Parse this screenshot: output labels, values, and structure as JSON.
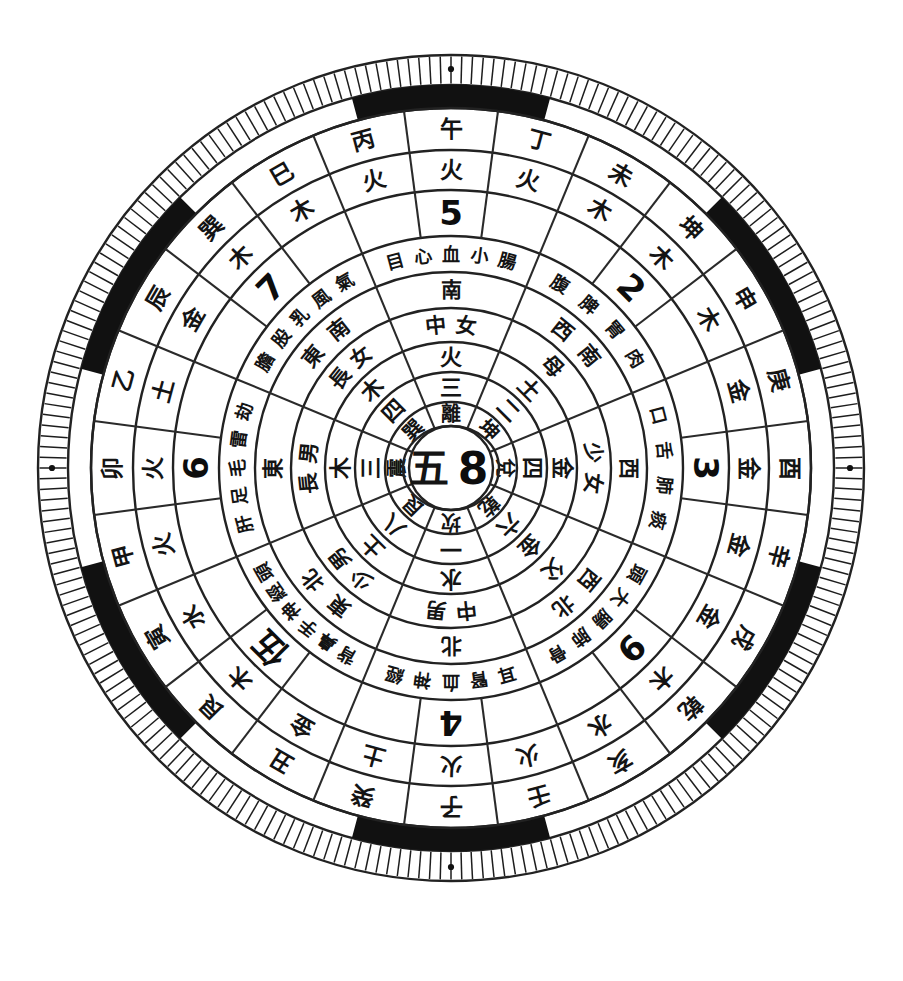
{
  "figure": {
    "kind": "luopan-compass",
    "title": "",
    "center_text_cn": "五",
    "center_text_num": "8",
    "background": "#ffffff",
    "ink_color": "#1a1a1a",
    "geometry": {
      "cx": 451,
      "cy": 468,
      "outer_radius": 413,
      "sectors": 24,
      "tick_count": 240
    }
  },
  "rings": {
    "r1_tick_ring": {
      "name": "outer-tick-ring",
      "r_outer": 413,
      "r_inner": 383,
      "ticks": 240,
      "note": "fine radial hatch marks"
    },
    "r2_black_white_ring": {
      "name": "black-white-segment-ring",
      "r_outer": 383,
      "r_inner": 360,
      "pattern": [
        "black",
        "white",
        "black",
        "white",
        "black",
        "white",
        "black",
        "white",
        "black",
        "white",
        "black",
        "white"
      ],
      "dots": 4,
      "dot_color": "#111111"
    },
    "r3_branch_ring": {
      "name": "earthly-branch-ring",
      "r_outer": 360,
      "r_inner": 318
    },
    "r4_element_ring": {
      "name": "five-element-ring",
      "r_outer": 318,
      "r_inner": 278
    },
    "r5_number_ring": {
      "name": "arabic-number-ring",
      "r_outer": 278,
      "r_inner": 232
    },
    "r6_body_ring": {
      "name": "body-organ-ring",
      "r_outer": 232,
      "r_inner": 196
    },
    "r7_direction_ring": {
      "name": "direction-ring",
      "r_outer": 196,
      "r_inner": 160
    },
    "r8_family_ring": {
      "name": "family-member-ring",
      "r_outer": 160,
      "r_inner": 126
    },
    "r9_element2_ring": {
      "name": "trigram-element-ring",
      "r_outer": 126,
      "r_inner": 96
    },
    "r10_cn_number_ring": {
      "name": "chinese-number-ring",
      "r_outer": 96,
      "r_inner": 66
    },
    "r11_trigram_ring": {
      "name": "eight-trigram-ring",
      "r_outer": 66,
      "r_inner": 42
    },
    "r12_center": {
      "name": "center-disc",
      "r_outer": 42
    }
  },
  "sectors24": {
    "label": "24-mountain branch ring (outermost lettered ring)",
    "branches": [
      "午",
      "丁",
      "未",
      "坤",
      "申",
      "庚",
      "酉",
      "辛",
      "戌",
      "乾",
      "亥",
      "壬",
      "子",
      "癸",
      "丑",
      "艮",
      "寅",
      "甲",
      "卯",
      "乙",
      "辰",
      "巽",
      "巳",
      "丙"
    ],
    "elements": [
      "火",
      "火",
      "木",
      "木",
      "木",
      "金",
      "金",
      "金",
      "金",
      "木",
      "水",
      "火",
      "火",
      "土",
      "金",
      "木",
      "水",
      "火",
      "火",
      "土",
      "金",
      "木",
      "木",
      "火"
    ]
  },
  "eight_palaces": [
    {
      "id": "li",
      "position_deg": 0,
      "trigram": "離",
      "cn_number": "三",
      "element": "火",
      "family": "中女",
      "direction": "南",
      "body": "目心血小腸",
      "number": "5",
      "nature": "麗"
    },
    {
      "id": "kun",
      "position_deg": 45,
      "trigram": "坤",
      "cn_number": "二",
      "element": "土",
      "family": "母",
      "direction": "西南",
      "body": "腹脾胃肉",
      "number": "2",
      "nature": "地"
    },
    {
      "id": "dui",
      "position_deg": 90,
      "trigram": "兌",
      "cn_number": "四",
      "element": "金",
      "family": "少女",
      "direction": "西",
      "body": "口舌肺痰",
      "number": "3",
      "nature": "澤"
    },
    {
      "id": "qian",
      "position_deg": 135,
      "trigram": "乾",
      "cn_number": "六",
      "element": "金",
      "family": "父",
      "direction": "西北",
      "body": "頭大腸肺骨",
      "number": "9",
      "nature": "天"
    },
    {
      "id": "kan",
      "position_deg": 180,
      "trigram": "坎",
      "cn_number": "一",
      "element": "水",
      "family": "中男",
      "direction": "北",
      "body": "耳腎血神經",
      "number": "4",
      "nature": "水"
    },
    {
      "id": "gen",
      "position_deg": 225,
      "trigram": "艮",
      "cn_number": "八",
      "element": "土",
      "family": "少男",
      "direction": "東北",
      "body": "背鼻手神經頭",
      "number": "伍",
      "nature": "山"
    },
    {
      "id": "zhen",
      "position_deg": 270,
      "trigram": "震",
      "cn_number": "三",
      "element": "木",
      "family": "長男",
      "direction": "東",
      "body": "肝足毛雷劫",
      "number": "6",
      "nature": "雷"
    },
    {
      "id": "xun",
      "position_deg": 315,
      "trigram": "巽",
      "cn_number": "四",
      "element": "木",
      "family": "長女",
      "direction": "東南",
      "body": "膽股乳風氣",
      "number": "7",
      "nature": "風"
    }
  ],
  "inner_number_ring": {
    "label": "chinese-number-ring values by palace",
    "values": [
      "三",
      "二",
      "四",
      "六",
      "一",
      "八",
      "三",
      "壹"
    ]
  },
  "outer_arabic_ring": {
    "label": "arabic-number-ring values by palace",
    "values": [
      "5",
      "2",
      "3",
      "9",
      "4",
      "伍",
      "6",
      "7"
    ]
  },
  "extra_numbers": {
    "label": "numerals visible in number ring",
    "values": [
      "1",
      "2",
      "3",
      "4",
      "5",
      "6",
      "7",
      "8",
      "9",
      "一",
      "二",
      "三",
      "四",
      "伍",
      "六",
      "柒",
      "八",
      "壹",
      "參"
    ]
  },
  "colors": {
    "ink": "#1a1a1a",
    "paper": "#ffffff",
    "segment_black": "#111111"
  }
}
